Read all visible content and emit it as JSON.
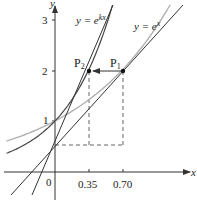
{
  "figure": {
    "axes": {
      "x_label": "x",
      "y_label": "y",
      "origin_label": "0",
      "x_ticks": [
        {
          "value": 0.35,
          "label": "0.35"
        },
        {
          "value": 0.7,
          "label": "0.70"
        }
      ],
      "y_ticks": [
        {
          "value": 1,
          "label": "1"
        },
        {
          "value": 2,
          "label": "2"
        },
        {
          "value": 3,
          "label": "3"
        }
      ]
    },
    "curves": [
      {
        "name": "exp-x",
        "label": "y = e^x",
        "label_base": "y = e",
        "label_exp": "x",
        "color": "#b0b0b0"
      },
      {
        "name": "exp-kx",
        "label": "y = e^kx",
        "label_base": "y = e",
        "label_exp": "kx",
        "color": "#444444"
      }
    ],
    "points": [
      {
        "name": "P1",
        "label": "P",
        "sub": "1",
        "x": 0.7,
        "y": 2
      },
      {
        "name": "P2",
        "label": "P",
        "sub": "2",
        "x": 0.35,
        "y": 2
      }
    ],
    "colors": {
      "axis": "#333333",
      "dark_curve": "#444444",
      "light_curve": "#b0b0b0",
      "dashed": "#555555"
    }
  }
}
